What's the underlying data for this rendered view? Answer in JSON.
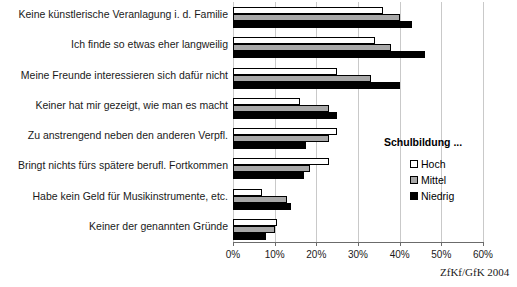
{
  "legend": {
    "title": "Schulbildung ...",
    "entries": [
      {
        "label": "Hoch",
        "swatch": "white-square-icon",
        "color": "#ffffff"
      },
      {
        "label": "Mittel",
        "swatch": "gray-square-icon",
        "color": "#a8a8a8"
      },
      {
        "label": "Niedrig",
        "swatch": "black-square-icon",
        "color": "#000000"
      }
    ]
  },
  "source": "ZfKf/GfK 2004",
  "chart_data": {
    "type": "bar",
    "orientation": "horizontal",
    "title": "",
    "subtitle": "",
    "xlabel": "",
    "ylabel": "",
    "xlim": [
      0,
      60
    ],
    "xticks": [
      0,
      10,
      20,
      30,
      40,
      50,
      60
    ],
    "xtick_labels": [
      "0%",
      "10%",
      "20%",
      "30%",
      "40%",
      "50%",
      "60%"
    ],
    "grid": true,
    "legend_position": "right",
    "categories": [
      "Keine künstlerische Veranlagung i. d. Familie",
      "Ich finde so etwas eher langweilig",
      "Meine Freunde interessieren sich dafür nicht",
      "Keiner hat mir gezeigt, wie man es macht",
      "Zu anstrengend neben den anderen Verpfl.",
      "Bringt nichts fürs spätere berufl. Fortkommen",
      "Habe kein Geld für Musikinstrumente, etc.",
      "Keiner der genannten Gründe"
    ],
    "series": [
      {
        "name": "Hoch",
        "color": "#ffffff",
        "values": [
          36,
          34,
          25,
          16,
          25,
          23,
          7,
          10.5
        ]
      },
      {
        "name": "Mittel",
        "color": "#a8a8a8",
        "values": [
          40,
          38,
          33,
          23,
          23,
          18.5,
          13,
          10
        ]
      },
      {
        "name": "Niedrig",
        "color": "#000000",
        "values": [
          43,
          46,
          40,
          25,
          17.5,
          17,
          14,
          8
        ]
      }
    ]
  }
}
